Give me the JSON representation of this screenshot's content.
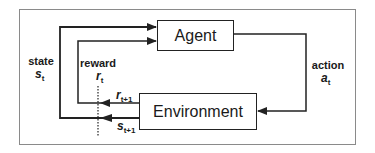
{
  "diagram": {
    "nodes": {
      "agent": {
        "label": "Agent"
      },
      "environment": {
        "label": "Environment"
      }
    },
    "labels": {
      "state": {
        "text": "state",
        "symbol": "s",
        "subscript": "t"
      },
      "reward": {
        "text": "reward",
        "symbol": "r",
        "subscript": "t"
      },
      "action": {
        "text": "action",
        "symbol": "a",
        "subscript": "t"
      },
      "next_reward": {
        "symbol": "r",
        "subscript": "t+1"
      },
      "next_state": {
        "symbol": "s",
        "subscript": "t+1"
      }
    },
    "edges": [
      {
        "from": "agent",
        "to": "environment",
        "label": "action a_t"
      },
      {
        "from": "environment",
        "to": "agent",
        "label": "reward r_t+1 -> r_t"
      },
      {
        "from": "environment",
        "to": "agent",
        "label": "state s_t+1 -> s_t"
      }
    ],
    "colors": {
      "line": "#222222",
      "frame": "#8a8a8a",
      "background": "#ffffff"
    }
  }
}
